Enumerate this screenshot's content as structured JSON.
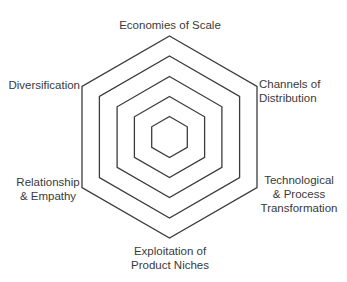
{
  "diagram": {
    "title": "",
    "type": "concentric hexagon radar framework",
    "center": [
      169.5,
      137
    ],
    "ring_radii": [
      101,
      81,
      60.5,
      40.5,
      20.5
    ],
    "stroke_color": "#3c3c3c",
    "background": "#ffffff",
    "axes": [
      {
        "id": "top",
        "lines": [
          "Economies of Scale"
        ]
      },
      {
        "id": "upper-right",
        "lines": [
          "Channels of",
          "Distribution"
        ]
      },
      {
        "id": "lower-right",
        "lines": [
          "Technological",
          "& Process",
          "Transformation"
        ]
      },
      {
        "id": "bottom",
        "lines": [
          "Exploitation of",
          "Product Niches"
        ]
      },
      {
        "id": "lower-left",
        "lines": [
          "Relationship",
          "& Empathy"
        ]
      },
      {
        "id": "upper-left",
        "lines": [
          "Diversification"
        ]
      }
    ]
  }
}
